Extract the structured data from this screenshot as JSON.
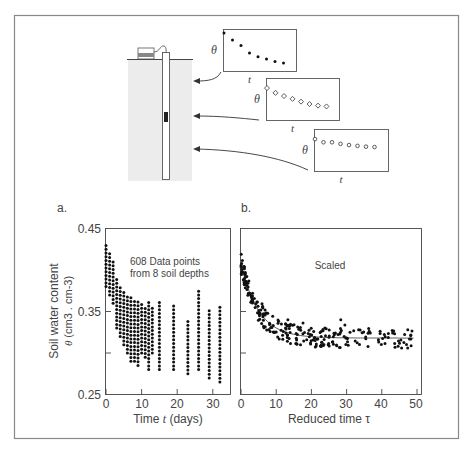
{
  "figure": {
    "inset_ylabel": "θ",
    "inset_xlabel": "t",
    "insets": [
      {
        "marker": "filled-dot",
        "points": [
          [
            0,
            0.95
          ],
          [
            1,
            0.78
          ],
          [
            2,
            0.64
          ],
          [
            3,
            0.45
          ],
          [
            4,
            0.36
          ],
          [
            5,
            0.3
          ],
          [
            6,
            0.24
          ],
          [
            7,
            0.2
          ]
        ]
      },
      {
        "marker": "open-diamond",
        "points": [
          [
            0,
            0.8
          ],
          [
            1,
            0.68
          ],
          [
            2,
            0.6
          ],
          [
            3,
            0.53
          ],
          [
            4,
            0.46
          ],
          [
            5,
            0.4
          ],
          [
            6,
            0.36
          ],
          [
            7,
            0.34
          ]
        ]
      },
      {
        "marker": "open-circle",
        "points": [
          [
            0,
            0.8
          ],
          [
            1,
            0.72
          ],
          [
            2,
            0.72
          ],
          [
            3,
            0.68
          ],
          [
            4,
            0.65
          ],
          [
            5,
            0.63
          ],
          [
            6,
            0.61
          ],
          [
            7,
            0.6
          ]
        ]
      }
    ]
  },
  "panel_a": {
    "label": "a.",
    "annotation_line1": "608 Data points",
    "annotation_line2": "from 8 soil depths",
    "ylabel_line1": "Soil water content",
    "ylabel_theta": "θ",
    "ylabel_unit": " (cm3 . cm-3)",
    "xlabel_prefix": "Time ",
    "xlabel_var": "t",
    "xlabel_suffix": " (days)",
    "yticks": [
      "0.45",
      "0.35",
      "0.25"
    ],
    "xticks": [
      "0",
      "10",
      "20",
      "30"
    ]
  },
  "panel_b": {
    "label": "b.",
    "annotation": "Scaled",
    "xlabel": "Reduced time τ",
    "xticks": [
      "0",
      "10",
      "20",
      "30",
      "40",
      "50"
    ]
  },
  "chart_data": [
    {
      "type": "scatter",
      "title": "a.",
      "annotation": "608 Data points from 8 soil depths",
      "xlabel": "Time t (days)",
      "ylabel": "Soil water content θ (cm3 . cm-3)",
      "xlim": [
        0,
        35
      ],
      "ylim": [
        0.25,
        0.45
      ],
      "xticks": [
        0,
        10,
        20,
        30
      ],
      "yticks": [
        0.25,
        0.3,
        0.35,
        0.45
      ],
      "ytick_labels": [
        "0.25",
        "0.35",
        "0.45"
      ],
      "grid": false,
      "columns": [
        {
          "x": 0,
          "ymin": 0.38,
          "ymax": 0.43
        },
        {
          "x": 1,
          "ymin": 0.37,
          "ymax": 0.42
        },
        {
          "x": 2,
          "ymin": 0.36,
          "ymax": 0.41
        },
        {
          "x": 3,
          "ymin": 0.33,
          "ymax": 0.39
        },
        {
          "x": 4,
          "ymin": 0.32,
          "ymax": 0.38
        },
        {
          "x": 5,
          "ymin": 0.31,
          "ymax": 0.375
        },
        {
          "x": 6,
          "ymin": 0.3,
          "ymax": 0.37
        },
        {
          "x": 7,
          "ymin": 0.29,
          "ymax": 0.37
        },
        {
          "x": 8,
          "ymin": 0.29,
          "ymax": 0.365
        },
        {
          "x": 9,
          "ymin": 0.285,
          "ymax": 0.365
        },
        {
          "x": 10,
          "ymin": 0.3,
          "ymax": 0.36
        },
        {
          "x": 11,
          "ymin": 0.295,
          "ymax": 0.355
        },
        {
          "x": 12,
          "ymin": 0.28,
          "ymax": 0.365
        },
        {
          "x": 13,
          "ymin": 0.3,
          "ymax": 0.355
        },
        {
          "x": 15,
          "ymin": 0.28,
          "ymax": 0.365
        },
        {
          "x": 19,
          "ymin": 0.28,
          "ymax": 0.36
        },
        {
          "x": 23,
          "ymin": 0.275,
          "ymax": 0.34
        },
        {
          "x": 26,
          "ymin": 0.28,
          "ymax": 0.375
        },
        {
          "x": 29,
          "ymin": 0.27,
          "ymax": 0.355
        },
        {
          "x": 32,
          "ymin": 0.265,
          "ymax": 0.355
        }
      ]
    },
    {
      "type": "scatter",
      "title": "b.",
      "annotation": "Scaled",
      "xlabel": "Reduced time τ",
      "ylabel": "",
      "xlim": [
        0,
        50
      ],
      "ylim": [
        0.25,
        0.45
      ],
      "xticks": [
        0,
        10,
        20,
        30,
        40,
        50
      ],
      "grid": false,
      "fit_curve": {
        "form": "0.318 + 0.09*exp(-tau/5)",
        "description": "exponential decay toward ~0.32"
      },
      "scatter_band": 0.012
    }
  ]
}
